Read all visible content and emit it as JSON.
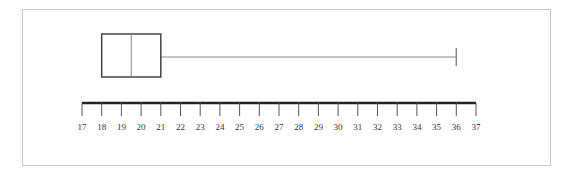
{
  "chart_data": {
    "type": "boxplot",
    "title": "",
    "xlabel": "",
    "ylabel": "",
    "orientation": "horizontal",
    "xlim": [
      17,
      37
    ],
    "ticks": [
      17,
      18,
      19,
      20,
      21,
      22,
      23,
      24,
      25,
      26,
      27,
      28,
      29,
      30,
      31,
      32,
      33,
      34,
      35,
      36,
      37
    ],
    "tick_labels": [
      "17",
      "18",
      "19",
      "20",
      "21",
      "22",
      "23",
      "24",
      "25",
      "26",
      "27",
      "28",
      "29",
      "30",
      "31",
      "32",
      "33",
      "34",
      "35",
      "36",
      "37"
    ],
    "box": {
      "min": 21,
      "q1": 18,
      "median": 19.5,
      "q3": 21,
      "max": 36
    },
    "grid": false,
    "colors": {
      "box_stroke": "#444444",
      "median": "#888888",
      "whisker": "#888888",
      "axis": "#222222"
    }
  }
}
